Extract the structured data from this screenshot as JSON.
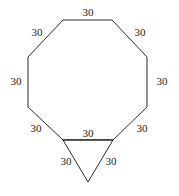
{
  "figure": {
    "name": "regular-octagon-with-downward-triangle",
    "stroke_color": "#2b2b2b",
    "fill_color": "#ffffff",
    "label_color": "#1a1a1a",
    "stroke_width": 1,
    "canvas": {
      "width": 179,
      "height": 196
    }
  },
  "shapes": {
    "octagon": {
      "name": "octagon",
      "sides": 8,
      "points": "63,20 112,20 147,57 147,107 113,140 63,140 28,107 28,57"
    },
    "triangle": {
      "name": "triangle",
      "sides": 3,
      "points": "63,140 113,140 88,182"
    },
    "shared_edge": {
      "name": "shared-bottom-edge",
      "x1": 63,
      "y1": 140,
      "x2": 113,
      "y2": 140
    }
  },
  "labels": [
    {
      "id": "top",
      "text": "30",
      "edge": "octagon-top-edge"
    },
    {
      "id": "upper_left",
      "text": "30",
      "edge": "octagon-upper-left-edge"
    },
    {
      "id": "upper_right",
      "text": "30",
      "edge": "octagon-upper-right-edge"
    },
    {
      "id": "left",
      "text": "30",
      "edge": "octagon-left-edge"
    },
    {
      "id": "right",
      "text": "30",
      "edge": "octagon-right-edge"
    },
    {
      "id": "lower_left",
      "text": "30",
      "edge": "octagon-lower-left-edge"
    },
    {
      "id": "lower_right",
      "text": "30",
      "edge": "octagon-lower-right-edge"
    },
    {
      "id": "bottom",
      "text": "30",
      "edge": "octagon-bottom-edge"
    },
    {
      "id": "tri_left",
      "text": "30",
      "edge": "triangle-left-edge"
    },
    {
      "id": "tri_right",
      "text": "30",
      "edge": "triangle-right-edge"
    }
  ],
  "label_values": {
    "top": "30",
    "upper_left": "30",
    "upper_right": "30",
    "left": "30",
    "right": "30",
    "lower_left": "30",
    "lower_right": "30",
    "bottom": "30",
    "tri_left": "30",
    "tri_right": "30"
  }
}
